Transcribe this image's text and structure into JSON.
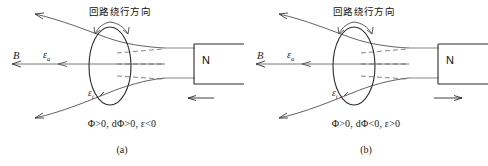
{
  "figure": {
    "type": "physics-diagram",
    "background_color": "#ffffff",
    "line_color": "#2b2b2b"
  },
  "panels": [
    {
      "id": "a",
      "caption": "(a)",
      "loop_title": "回路绕行方向",
      "labels": {
        "field": "B",
        "emf_area": "ε",
        "emf_area_sub": "a",
        "emf_induced": "ε",
        "emf_induced_sub": "i",
        "magnet_pole": "N"
      },
      "formula": "Φ>0, dΦ>0, ε<0",
      "magnet_motion": "left",
      "magnet_motion_label": "arrow-left",
      "field_direction": "left",
      "circulation": "clockwise-from-front"
    },
    {
      "id": "b",
      "caption": "(b)",
      "loop_title": "回路绕行方向",
      "labels": {
        "field": "B",
        "emf_area": "ε",
        "emf_area_sub": "a",
        "emf_induced": "ε",
        "emf_induced_sub": "i",
        "magnet_pole": "N"
      },
      "formula": "Φ>0, dΦ<0, ε>0",
      "magnet_motion": "right",
      "magnet_motion_label": "arrow-right",
      "field_direction": "left",
      "circulation": "clockwise-from-front"
    }
  ]
}
